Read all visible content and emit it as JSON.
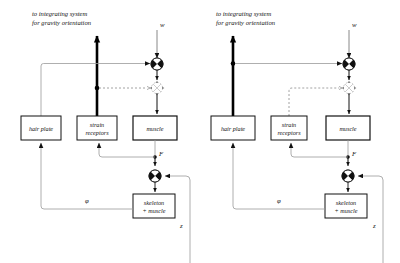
{
  "figure": {
    "title": "",
    "background": "#ffffff",
    "line_color": "#6b6b6b",
    "heavy_color": "#000000",
    "dashed_color": "#8a8a8a",
    "box_stroke": "#111111",
    "panels": [
      {
        "id": "left-panel",
        "caption_line1": "to integrating system",
        "caption_line2": "for gravity orientation",
        "input_label": "w",
        "boxes": [
          {
            "id": "hair-plate",
            "label_line1": "hair plate",
            "label_line2": ""
          },
          {
            "id": "strain-receptors",
            "label_line1": "strain",
            "label_line2": "receptors"
          },
          {
            "id": "muscle",
            "label_line1": "muscle",
            "label_line2": ""
          },
          {
            "id": "skeleton-muscle",
            "label_line1": "skeleton",
            "label_line2": "+ muscle"
          }
        ],
        "signals": {
          "force": "F",
          "angle": "φ",
          "disturbance": "z"
        },
        "emphasis": "strain-receptors",
        "dashed_source": "strain-receptors"
      },
      {
        "id": "right-panel",
        "caption_line1": "to integrating system",
        "caption_line2": "for gravity orientation",
        "input_label": "w",
        "boxes": [
          {
            "id": "hair-plate",
            "label_line1": "hair plate",
            "label_line2": ""
          },
          {
            "id": "strain-receptors",
            "label_line1": "strain",
            "label_line2": "receptors"
          },
          {
            "id": "muscle",
            "label_line1": "muscle",
            "label_line2": ""
          },
          {
            "id": "skeleton-muscle",
            "label_line1": "skeleton",
            "label_line2": "+ muscle"
          }
        ],
        "signals": {
          "force": "F",
          "angle": "φ",
          "disturbance": "z"
        },
        "emphasis": "hair-plate",
        "dashed_source": "strain-receptors"
      }
    ],
    "nodes": {
      "summing_junction": "summing-junction-icon",
      "dotted_junction": "dotted-comparator-icon",
      "branch_dot": "branch-node-icon",
      "arrow_head": "arrowhead-icon"
    }
  }
}
